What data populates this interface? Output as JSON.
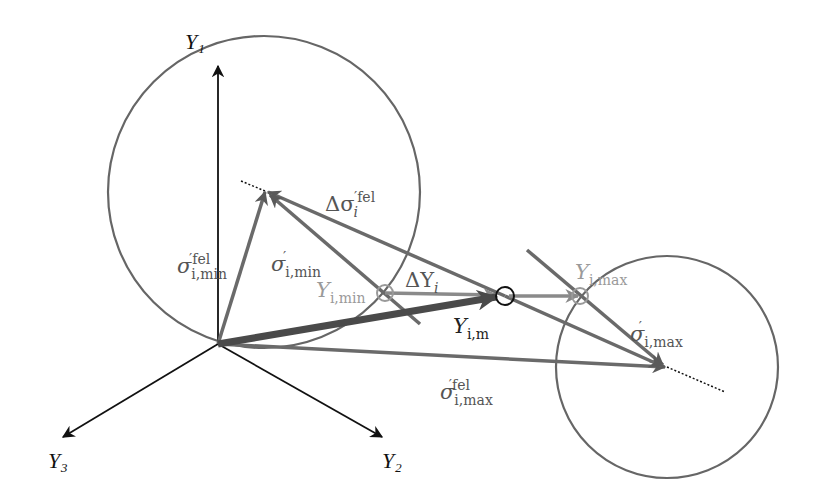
{
  "diagram": {
    "type": "vector-diagram",
    "axes": {
      "y1": "Y₁",
      "y2": "Y₂",
      "y3": "Y₃"
    },
    "labels": {
      "delta_sigma_fel": {
        "main": "Δσ",
        "sub": "i",
        "sup": "′fel"
      },
      "sigma_min_fel": {
        "main": "σ",
        "sub": "i,min",
        "sup": "′fel"
      },
      "sigma_min": {
        "main": "σ",
        "sub": "i,min",
        "sup": "′"
      },
      "y_min": {
        "main": "Y",
        "sub": "i,min"
      },
      "delta_y": {
        "main": "ΔY",
        "sub": "i"
      },
      "y_m": {
        "main": "Y",
        "sub": "i,m"
      },
      "y_max": {
        "main": "Y",
        "sub": "i,max"
      },
      "sigma_max": {
        "main": "σ",
        "sub": "i,max",
        "sup": "′"
      },
      "sigma_max_fel": {
        "main": "σ",
        "sub": "i,max",
        "sup": "′fel"
      }
    },
    "colors": {
      "axis": "#111111",
      "vector_dark": "#5a5a5a",
      "vector_light": "#9a9a9a",
      "circle": "#666666"
    }
  }
}
